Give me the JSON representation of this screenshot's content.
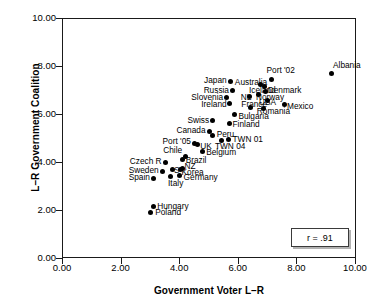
{
  "chart_data": {
    "type": "scatter",
    "title": "",
    "xlabel": "Government Voter L–R",
    "ylabel": "L–R Government Coalition",
    "xlim": [
      0,
      10
    ],
    "ylim": [
      0,
      10
    ],
    "xticks": [
      "0.00",
      "2.00",
      "4.00",
      "6.00",
      "8.00",
      "10.00"
    ],
    "yticks": [
      "0.00",
      "2.00",
      "4.00",
      "6.00",
      "8.00",
      "10.00"
    ],
    "grid": false,
    "legend": "none",
    "annotation": "r = .91",
    "point_color": "#000000",
    "points": [
      {
        "label": "Albania",
        "x": 9.2,
        "y": 7.7,
        "lx": 9.25,
        "ly": 8.05,
        "side": "right"
      },
      {
        "label": "Port '02",
        "x": 7.15,
        "y": 7.45,
        "lx": 6.98,
        "ly": 7.82,
        "side": "right"
      },
      {
        "label": "Japan",
        "x": 5.75,
        "y": 7.35,
        "lx": 5.62,
        "ly": 7.4,
        "side": "left"
      },
      {
        "label": "Australia",
        "x": 6.78,
        "y": 7.25,
        "lx": 5.9,
        "ly": 7.32,
        "side": "right"
      },
      {
        "label": "Iceland",
        "x": 6.92,
        "y": 7.15,
        "lx": 6.38,
        "ly": 6.98,
        "side": "right"
      },
      {
        "label": "Denmark",
        "x": 6.95,
        "y": 6.92,
        "lx": 7.02,
        "ly": 6.98,
        "side": "right"
      },
      {
        "label": "Russia",
        "x": 5.82,
        "y": 7.0,
        "lx": 5.7,
        "ly": 7.0,
        "side": "left"
      },
      {
        "label": "Norway",
        "x": 6.72,
        "y": 6.8,
        "lx": 6.62,
        "ly": 6.72,
        "side": "right"
      },
      {
        "label": "NL",
        "x": 6.4,
        "y": 6.72,
        "lx": 6.1,
        "ly": 6.7,
        "side": "right"
      },
      {
        "label": "Slovenia",
        "x": 5.6,
        "y": 6.68,
        "lx": 5.5,
        "ly": 6.72,
        "side": "left"
      },
      {
        "label": "USA",
        "x": 7.0,
        "y": 6.55,
        "lx": 6.72,
        "ly": 6.48,
        "side": "right"
      },
      {
        "label": "France",
        "x": 6.42,
        "y": 6.28,
        "lx": 6.12,
        "ly": 6.42,
        "side": "right"
      },
      {
        "label": "Ireland",
        "x": 5.72,
        "y": 6.45,
        "lx": 5.62,
        "ly": 6.42,
        "side": "left"
      },
      {
        "label": "Mexico",
        "x": 7.58,
        "y": 6.38,
        "lx": 7.68,
        "ly": 6.32,
        "side": "right"
      },
      {
        "label": "Romania",
        "x": 6.88,
        "y": 6.22,
        "lx": 6.65,
        "ly": 6.12,
        "side": "right"
      },
      {
        "label": "Bulgaria",
        "x": 5.9,
        "y": 5.98,
        "lx": 6.02,
        "ly": 5.92,
        "side": "right"
      },
      {
        "label": "Swiss",
        "x": 5.15,
        "y": 5.72,
        "lx": 5.02,
        "ly": 5.75,
        "side": "left"
      },
      {
        "label": "Finland",
        "x": 5.7,
        "y": 5.62,
        "lx": 5.82,
        "ly": 5.58,
        "side": "right"
      },
      {
        "label": "Canada",
        "x": 5.02,
        "y": 5.28,
        "lx": 4.9,
        "ly": 5.32,
        "side": "left"
      },
      {
        "label": "Peru",
        "x": 5.15,
        "y": 5.12,
        "lx": 5.28,
        "ly": 5.18,
        "side": "right"
      },
      {
        "label": "TWN 01",
        "x": 5.68,
        "y": 4.92,
        "lx": 5.82,
        "ly": 4.95,
        "side": "right"
      },
      {
        "label": "Port '05",
        "x": 4.52,
        "y": 4.78,
        "lx": 4.4,
        "ly": 4.88,
        "side": "left"
      },
      {
        "label": "UK",
        "x": 4.62,
        "y": 4.72,
        "lx": 4.72,
        "ly": 4.65,
        "side": "right"
      },
      {
        "label": "TWN 04",
        "x": 5.45,
        "y": 4.9,
        "lx": 5.22,
        "ly": 4.68,
        "side": "right"
      },
      {
        "label": "Belgium",
        "x": 4.78,
        "y": 4.45,
        "lx": 4.92,
        "ly": 4.42,
        "side": "right"
      },
      {
        "label": "Chile",
        "x": 4.22,
        "y": 4.22,
        "lx": 4.1,
        "ly": 4.52,
        "side": "left"
      },
      {
        "label": "Brazil",
        "x": 4.1,
        "y": 4.1,
        "lx": 4.22,
        "ly": 4.1,
        "side": "right"
      },
      {
        "label": "Czech R",
        "x": 3.52,
        "y": 4.0,
        "lx": 3.4,
        "ly": 4.05,
        "side": "left"
      },
      {
        "label": "NZ",
        "x": 4.12,
        "y": 3.75,
        "lx": 4.18,
        "ly": 3.82,
        "side": "right"
      },
      {
        "label": "Sweden",
        "x": 3.42,
        "y": 3.62,
        "lx": 3.3,
        "ly": 3.68,
        "side": "left"
      },
      {
        "label": "Korea",
        "x": 4.05,
        "y": 3.7,
        "lx": 4.08,
        "ly": 3.58,
        "side": "right"
      },
      {
        "label": "S",
        "x": 3.78,
        "y": 3.68,
        "lx": 3.82,
        "ly": 3.68,
        "side": "right"
      },
      {
        "label": "Germany",
        "x": 4.02,
        "y": 3.42,
        "lx": 4.15,
        "ly": 3.38,
        "side": "right"
      },
      {
        "label": "Spain",
        "x": 3.12,
        "y": 3.32,
        "lx": 3.0,
        "ly": 3.38,
        "side": "left"
      },
      {
        "label": "Italy",
        "x": 3.7,
        "y": 3.4,
        "lx": 3.62,
        "ly": 3.12,
        "side": "right"
      },
      {
        "label": "Hungary",
        "x": 3.12,
        "y": 2.15,
        "lx": 3.25,
        "ly": 2.15,
        "side": "right"
      },
      {
        "label": "Poland",
        "x": 3.02,
        "y": 1.88,
        "lx": 3.18,
        "ly": 1.9,
        "side": "right"
      }
    ]
  }
}
